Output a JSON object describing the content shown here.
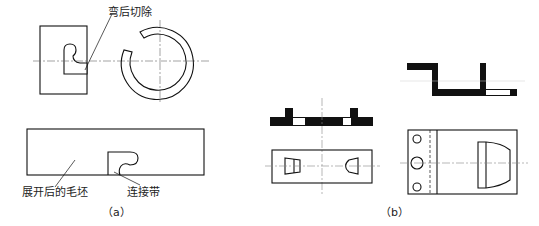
{
  "figure": {
    "panel_a": {
      "caption": "（a）",
      "labels": {
        "cut_after_bending": "弯后切除",
        "unfolded_blank": "展开后的毛坯",
        "connecting_strip": "连接带"
      }
    },
    "panel_b": {
      "caption": "（b）"
    }
  }
}
